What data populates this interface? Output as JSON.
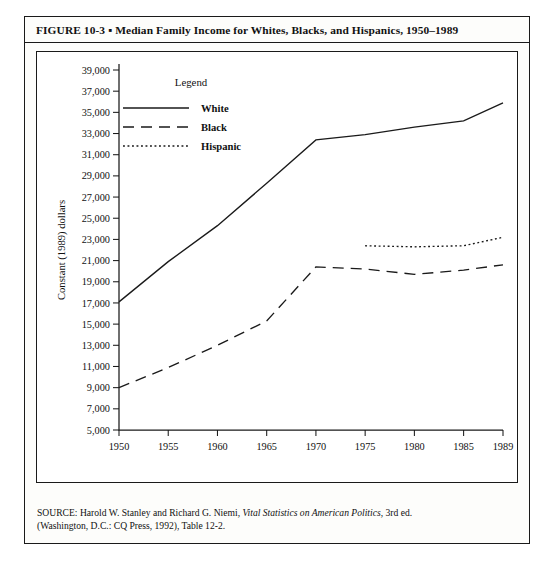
{
  "figure": {
    "title": "FIGURE 10-3 ▪ Median Family Income for Whites, Blacks, and Hispanics, 1950–1989",
    "source_line1_plain": "SOURCE: Harold W. Stanley and Richard G. Niemi, ",
    "source_line1_italic": "Vital Statistics on American Politics",
    "source_line1_tail": ", 3rd ed.",
    "source_line2": "(Washington, D.C.: CQ Press, 1992), Table 12-2."
  },
  "legend": {
    "title": "Legend",
    "entries": [
      {
        "label": "White",
        "style": "solid"
      },
      {
        "label": "Black",
        "style": "dashed"
      },
      {
        "label": "Hispanic",
        "style": "dotted"
      }
    ]
  },
  "chart_data": {
    "type": "line",
    "xlabel": "",
    "ylabel": "Constant (1989) dollars",
    "xlim": [
      1950,
      1989
    ],
    "ylim": [
      5000,
      39000
    ],
    "grid": false,
    "legend_position": "top-left-inside",
    "x_tick_labels": [
      "1950",
      "1955",
      "1960",
      "1965",
      "1970",
      "1975",
      "1980",
      "1985",
      "1989"
    ],
    "x_ticks": [
      1950,
      1955,
      1960,
      1965,
      1970,
      1975,
      1980,
      1985,
      1989
    ],
    "y_tick_labels": [
      "5,000",
      "7,000",
      "9,000",
      "11,000",
      "13,000",
      "15,000",
      "17,000",
      "19,000",
      "21,000",
      "23,000",
      "25,000",
      "27,000",
      "29,000",
      "31,000",
      "33,000",
      "35,000",
      "37,000",
      "39,000"
    ],
    "y_ticks": [
      5000,
      7000,
      9000,
      11000,
      13000,
      15000,
      17000,
      19000,
      21000,
      23000,
      25000,
      27000,
      29000,
      31000,
      33000,
      35000,
      37000,
      39000
    ],
    "series": [
      {
        "name": "White",
        "style": "solid",
        "x": [
          1950,
          1955,
          1960,
          1965,
          1970,
          1975,
          1980,
          1985,
          1989
        ],
        "values": [
          17100,
          20900,
          24300,
          28300,
          32400,
          32900,
          33600,
          34200,
          35900
        ]
      },
      {
        "name": "Black",
        "style": "dashed",
        "x": [
          1950,
          1955,
          1960,
          1965,
          1970,
          1975,
          1980,
          1985,
          1989
        ],
        "values": [
          9000,
          10900,
          13000,
          15300,
          20400,
          20200,
          19700,
          20100,
          20600
        ]
      },
      {
        "name": "Hispanic",
        "style": "dotted",
        "x": [
          1975,
          1980,
          1985,
          1989
        ],
        "values": [
          22400,
          22300,
          22400,
          23200
        ]
      }
    ]
  }
}
